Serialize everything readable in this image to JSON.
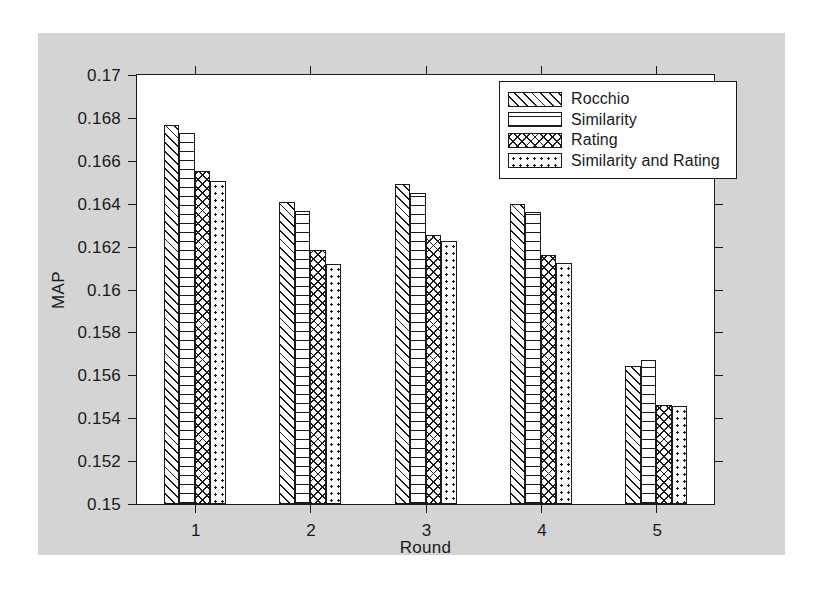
{
  "chart_data": {
    "type": "bar",
    "title": "",
    "xlabel": "Round",
    "ylabel": "MAP",
    "categories": [
      "1",
      "2",
      "3",
      "4",
      "5"
    ],
    "ylim": [
      0.15,
      0.17
    ],
    "ytick_labels": [
      "0.15",
      "0.152",
      "0.154",
      "0.156",
      "0.158",
      "0.16",
      "0.162",
      "0.164",
      "0.166",
      "0.168",
      "0.17"
    ],
    "ytick_values": [
      0.15,
      0.152,
      0.154,
      0.156,
      0.158,
      0.16,
      0.162,
      0.164,
      0.166,
      0.168,
      0.17
    ],
    "grid": false,
    "legend_position": "top-right",
    "series": [
      {
        "name": "Rocchio",
        "pattern": "diagonal-hatch",
        "values": [
          0.16765,
          0.1641,
          0.1649,
          0.164,
          0.15642
        ]
      },
      {
        "name": "Similarity",
        "pattern": "horizontal-lines",
        "values": [
          0.1673,
          0.16368,
          0.1645,
          0.16362,
          0.15672
        ]
      },
      {
        "name": "Rating",
        "pattern": "crosshatch",
        "values": [
          0.16553,
          0.16183,
          0.16252,
          0.16163,
          0.15463
        ]
      },
      {
        "name": "Similarity and Rating",
        "pattern": "dotted",
        "values": [
          0.16508,
          0.16118,
          0.16228,
          0.16122,
          0.15455
        ]
      }
    ]
  },
  "legend": {
    "entries": [
      {
        "label": "Rocchio"
      },
      {
        "label": "Similarity"
      },
      {
        "label": "Rating"
      },
      {
        "label": "Similarity and Rating"
      }
    ]
  },
  "axes": {
    "y_label": "MAP",
    "x_label": "Round"
  },
  "colors": {
    "figure_background": "#d4d4d4",
    "axes_background": "#ffffff",
    "ink": "#1a1a1a"
  }
}
